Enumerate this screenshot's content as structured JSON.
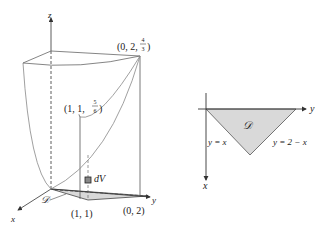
{
  "figure_left": {
    "axes": {
      "x": "x",
      "y": "y",
      "z": "z"
    },
    "points": {
      "top": {
        "prefix": "(0, 2, ",
        "num": "4",
        "den": "3",
        "suffix": ")"
      },
      "mid": {
        "prefix": "(1, 1, ",
        "num": "5",
        "den": "6",
        "suffix": ")"
      },
      "base1": "(1, 1)",
      "base2": "(0, 2)"
    },
    "region_label": "𝒟",
    "volume_element": "dV"
  },
  "figure_right": {
    "axes": {
      "x": "x",
      "y": "y"
    },
    "region_label": "𝒟",
    "left_edge": "y = x",
    "right_edge": "y = 2 − x"
  },
  "colors": {
    "line": "#666666",
    "axis": "#333333",
    "region_fill": "#d9d9d9",
    "region_edge": "#444444"
  }
}
